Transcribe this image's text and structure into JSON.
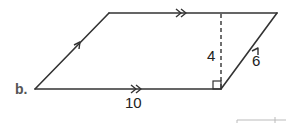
{
  "diagram": {
    "part_label": "b.",
    "shape": "parallelogram",
    "base_label": "10",
    "height_label": "4",
    "side_label": "6",
    "stroke_color": "#333333",
    "label_color": "#222222"
  }
}
